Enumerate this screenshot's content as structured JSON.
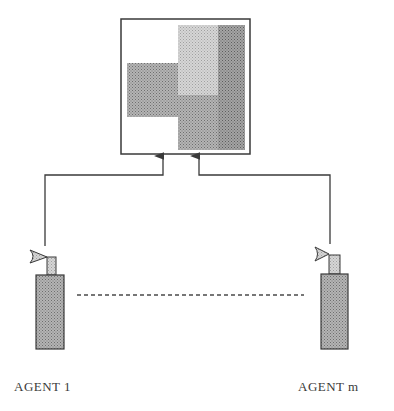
{
  "diagram": {
    "type": "multi-agent-sensor-diagram",
    "shared_map": {
      "name": "shared-map",
      "regions": [
        {
          "name": "left-block",
          "shade": "medium"
        },
        {
          "name": "upper-light-block",
          "shade": "light"
        },
        {
          "name": "right-column",
          "shade": "dark"
        },
        {
          "name": "lower-right-block",
          "shade": "medium"
        }
      ]
    },
    "agents": [
      {
        "id": "agent-1",
        "label": "AGENT 1"
      },
      {
        "id": "agent-m",
        "label": "AGENT m"
      }
    ],
    "connector": {
      "style": "dashed",
      "meaning": "agents 2..m-1 omitted"
    },
    "colors": {
      "line": "#3a3a3a",
      "fill_medium": "#a8a8a8",
      "fill_light": "#cfcfcf",
      "fill_dark": "#9a9a9a",
      "background": "#ffffff"
    }
  }
}
